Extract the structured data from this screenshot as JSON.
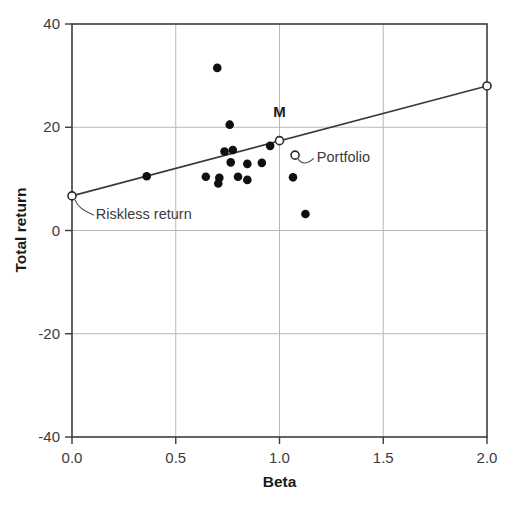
{
  "chart_data": {
    "type": "scatter",
    "title": "",
    "xlabel": "Beta",
    "ylabel": "Total return",
    "xlim": [
      0.0,
      2.0
    ],
    "ylim": [
      -40,
      40
    ],
    "xticks": [
      "0.0",
      "0.5",
      "1.0",
      "1.5",
      "2.0"
    ],
    "xtick_values": [
      0.0,
      0.5,
      1.0,
      1.5,
      2.0
    ],
    "yticks": [
      "40",
      "20",
      "0",
      "-20",
      "-40"
    ],
    "ytick_values": [
      40,
      20,
      0,
      -20,
      -40
    ],
    "grid": "both",
    "legend": "none",
    "series": [
      {
        "name": "Securities",
        "marker": "filled-circle",
        "points": [
          {
            "x": 0.36,
            "y": 10.5
          },
          {
            "x": 0.7,
            "y": 31.5
          },
          {
            "x": 0.76,
            "y": 20.5
          },
          {
            "x": 0.645,
            "y": 10.4
          },
          {
            "x": 0.705,
            "y": 9.1
          },
          {
            "x": 0.71,
            "y": 10.2
          },
          {
            "x": 0.735,
            "y": 15.3
          },
          {
            "x": 0.775,
            "y": 15.6
          },
          {
            "x": 0.765,
            "y": 13.2
          },
          {
            "x": 0.8,
            "y": 10.4
          },
          {
            "x": 0.845,
            "y": 12.9
          },
          {
            "x": 0.845,
            "y": 9.8
          },
          {
            "x": 0.915,
            "y": 13.1
          },
          {
            "x": 0.955,
            "y": 16.4
          },
          {
            "x": 1.065,
            "y": 10.3
          },
          {
            "x": 1.125,
            "y": 3.2
          }
        ]
      },
      {
        "name": "Market portfolio M",
        "marker": "open-circle",
        "points": [
          {
            "x": 1.0,
            "y": 17.4
          }
        ]
      },
      {
        "name": "Portfolio",
        "marker": "open-circle",
        "points": [
          {
            "x": 1.075,
            "y": 14.6
          }
        ]
      },
      {
        "name": "Riskless return",
        "marker": "open-circle",
        "points": [
          {
            "x": 0.0,
            "y": 6.7
          }
        ]
      },
      {
        "name": "Security market line endpoint",
        "marker": "open-circle",
        "points": [
          {
            "x": 2.0,
            "y": 28.0
          }
        ]
      }
    ],
    "line": {
      "name": "Security market line",
      "from": {
        "x": 0.0,
        "y": 6.7
      },
      "to": {
        "x": 2.0,
        "y": 28.0
      },
      "intercept": 6.7,
      "slope": 10.65
    },
    "annotations": [
      {
        "id": "market-label",
        "text": "M",
        "x": 1.0,
        "y": 22.0
      },
      {
        "id": "portfolio-label",
        "text": "Portfolio",
        "x": 1.18,
        "y": 13.2
      },
      {
        "id": "riskless-label",
        "text": "Riskless return",
        "x": 0.115,
        "y": 2.2
      }
    ]
  },
  "axes": {
    "x": {
      "label": "Beta",
      "ticks": [
        "0.0",
        "0.5",
        "1.0",
        "1.5",
        "2.0"
      ]
    },
    "y": {
      "label": "Total return",
      "ticks": [
        "40",
        "20",
        "0",
        "-20",
        "-40"
      ]
    }
  },
  "labels": {
    "market": "M",
    "portfolio": "Portfolio",
    "riskless": "Riskless return"
  },
  "colors": {
    "background": "#ffffff",
    "frame": "#3c3c3c",
    "grid": "#b9b9b9",
    "line": "#3a3a3a",
    "marker_fill": "#101010",
    "marker_open_fill": "#ffffff",
    "text": "#231f20"
  }
}
